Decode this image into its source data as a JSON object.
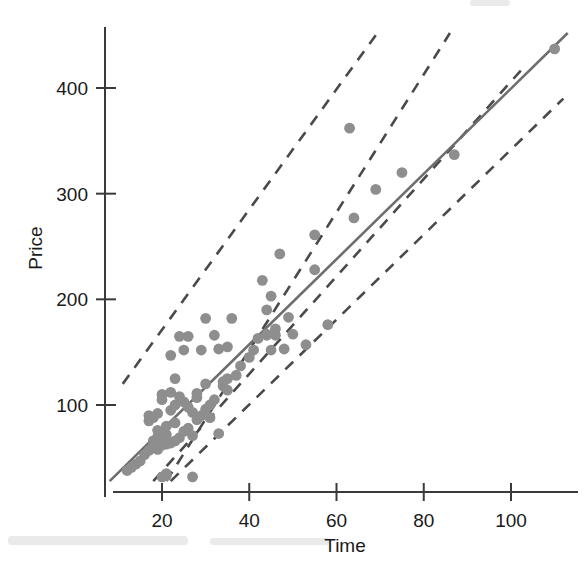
{
  "chart_data": {
    "type": "scatter",
    "title": "",
    "xlabel": "Time",
    "ylabel": "Price",
    "xlim": [
      8,
      115
    ],
    "ylim": [
      25,
      455
    ],
    "xticks": [
      20,
      40,
      60,
      80,
      100
    ],
    "xtick_labels": [
      "20",
      "40",
      "60",
      "80",
      "100"
    ],
    "yticks": [
      100,
      200,
      300,
      400
    ],
    "ytick_labels": [
      "100",
      "200",
      "300",
      "400"
    ],
    "grid": false,
    "legend": null,
    "marker_color": "#8e8e8e",
    "fit_line_color": "#6e6e6e",
    "band_line_color": "#4a4a4a",
    "series": [
      {
        "name": "observations",
        "marker": "circle",
        "points": [
          [
            12,
            38
          ],
          [
            13,
            41
          ],
          [
            14,
            44
          ],
          [
            15,
            47
          ],
          [
            16,
            53
          ],
          [
            17,
            57
          ],
          [
            17,
            85
          ],
          [
            17,
            90
          ],
          [
            18,
            61
          ],
          [
            18,
            66
          ],
          [
            18,
            88
          ],
          [
            19,
            58
          ],
          [
            19,
            70
          ],
          [
            19,
            76
          ],
          [
            19,
            92
          ],
          [
            20,
            62
          ],
          [
            20,
            68
          ],
          [
            20,
            105
          ],
          [
            20,
            110
          ],
          [
            20,
            32
          ],
          [
            21,
            63
          ],
          [
            21,
            72
          ],
          [
            21,
            80
          ],
          [
            21,
            33
          ],
          [
            21,
            35
          ],
          [
            22,
            64
          ],
          [
            22,
            95
          ],
          [
            22,
            112
          ],
          [
            22,
            147
          ],
          [
            23,
            66
          ],
          [
            23,
            83
          ],
          [
            23,
            100
          ],
          [
            23,
            125
          ],
          [
            24,
            69
          ],
          [
            24,
            108
          ],
          [
            24,
            165
          ],
          [
            25,
            75
          ],
          [
            25,
            103
          ],
          [
            25,
            152
          ],
          [
            26,
            78
          ],
          [
            26,
            98
          ],
          [
            26,
            165
          ],
          [
            27,
            71
          ],
          [
            27,
            93
          ],
          [
            27,
            32
          ],
          [
            28,
            86
          ],
          [
            28,
            111
          ],
          [
            28,
            107
          ],
          [
            29,
            90
          ],
          [
            29,
            152
          ],
          [
            30,
            96
          ],
          [
            30,
            120
          ],
          [
            30,
            182
          ],
          [
            31,
            100
          ],
          [
            31,
            88
          ],
          [
            32,
            105
          ],
          [
            32,
            166
          ],
          [
            33,
            73
          ],
          [
            33,
            153
          ],
          [
            34,
            122
          ],
          [
            34,
            118
          ],
          [
            35,
            125
          ],
          [
            35,
            114
          ],
          [
            35,
            155
          ],
          [
            36,
            182
          ],
          [
            37,
            128
          ],
          [
            38,
            137
          ],
          [
            40,
            145
          ],
          [
            41,
            152
          ],
          [
            42,
            163
          ],
          [
            43,
            218
          ],
          [
            44,
            190
          ],
          [
            44,
            167
          ],
          [
            44,
            166
          ],
          [
            45,
            203
          ],
          [
            45,
            152
          ],
          [
            46,
            172
          ],
          [
            46,
            166
          ],
          [
            47,
            243
          ],
          [
            48,
            153
          ],
          [
            49,
            183
          ],
          [
            50,
            167
          ],
          [
            53,
            157
          ],
          [
            55,
            228
          ],
          [
            55,
            261
          ],
          [
            58,
            176
          ],
          [
            63,
            362
          ],
          [
            64,
            277
          ],
          [
            69,
            304
          ],
          [
            75,
            320
          ],
          [
            87,
            337
          ],
          [
            110,
            437
          ]
        ]
      }
    ],
    "fit_line": {
      "name": "least-squares regression line",
      "x": [
        8,
        113
      ],
      "y": [
        28,
        452
      ]
    },
    "band_lines": [
      {
        "name": "upper outer band",
        "x": [
          11,
          69
        ],
        "y": [
          120,
          450
        ]
      },
      {
        "name": "upper inner band",
        "x": [
          21,
          86
        ],
        "y": [
          28,
          452
        ]
      },
      {
        "name": "lower inner band",
        "x": [
          18,
          103
        ],
        "y": [
          28,
          420
        ]
      },
      {
        "name": "lower outer band",
        "x": [
          22,
          112
        ],
        "y": [
          28,
          390
        ]
      }
    ]
  },
  "axes": {
    "x_title": "Time",
    "y_title": "Price"
  }
}
